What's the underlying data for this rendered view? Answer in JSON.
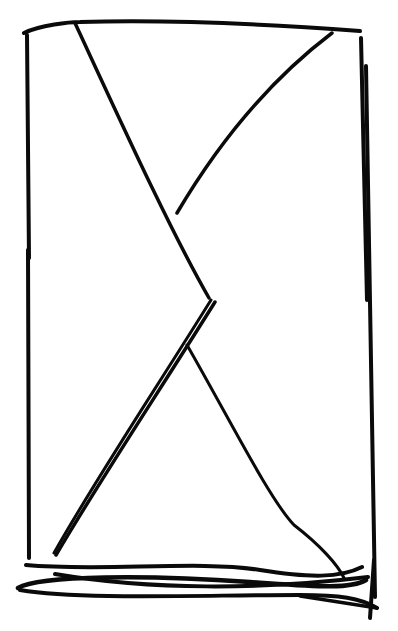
{
  "drawing": {
    "subject": "hand-drawn rectangle with crossing diagonal lines (X-like sketch)",
    "background": "#ffffff",
    "stroke_color": "#0a0a0a",
    "strokes": [
      {
        "name": "top-edge",
        "d": "M24,33 C40,25 70,22 80,22 C180,19 280,25 360,31",
        "width": 4
      },
      {
        "name": "left-edge",
        "d": "M27,35 L29,258",
        "width": 4
      },
      {
        "name": "right-edge-inner",
        "d": "M361,38 L367,300",
        "width": 4
      },
      {
        "name": "right-edge-outer",
        "d": "M366,66 L375,597",
        "width": 4
      },
      {
        "name": "diag-upper-left",
        "d": "M75,23 C120,120 170,230 209,298",
        "width": 3.5
      },
      {
        "name": "curve-upper-right",
        "d": "M332,33 C270,80 220,140 177,213",
        "width": 3.5
      },
      {
        "name": "diag-lower-left-a",
        "d": "M215,302 C160,390 100,480 56,555",
        "width": 3.5
      },
      {
        "name": "diag-lower-left-b",
        "d": "M211,300 C155,390 95,480 54,553",
        "width": 3
      },
      {
        "name": "curve-lower-right",
        "d": "M187,345 C230,420 270,500 294,525 C320,545 338,565 344,578",
        "width": 3
      },
      {
        "name": "left-edge-lower",
        "d": "M28,250 L29,558",
        "width": 4
      },
      {
        "name": "bottom-scribble-1",
        "d": "M26,565 C100,572 200,560 260,570 C310,578 340,578 362,567",
        "width": 4
      },
      {
        "name": "bottom-scribble-2",
        "d": "M55,574 C150,590 260,590 368,577",
        "width": 4
      },
      {
        "name": "bottom-scribble-3",
        "d": "M18,588 C40,575 150,575 250,582 C310,586 350,590 366,580",
        "width": 4.5
      },
      {
        "name": "bottom-scribble-4",
        "d": "M20,590 C80,600 200,595 300,595 C340,595 360,598 377,608",
        "width": 4
      },
      {
        "name": "right-corner-stroke",
        "d": "M374,560 L370,618",
        "width": 4
      },
      {
        "name": "bottom-right-tail",
        "d": "M300,596 L377,608",
        "width": 3.5
      }
    ]
  }
}
